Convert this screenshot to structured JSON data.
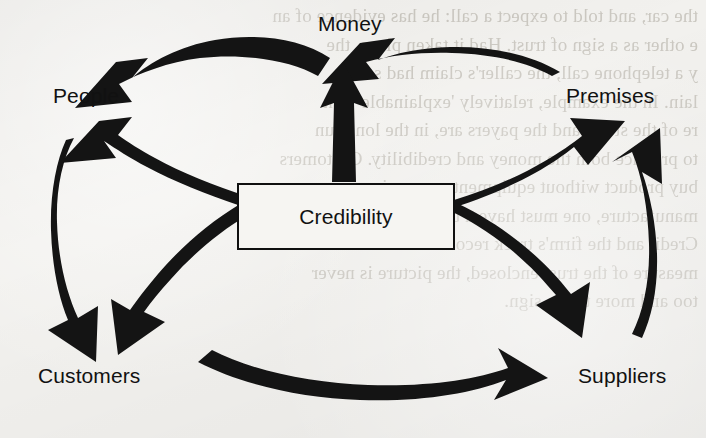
{
  "diagram": {
    "center": {
      "label": "Credibility"
    },
    "nodes": [
      {
        "id": "money",
        "label": "Money",
        "x": 318,
        "y": 12
      },
      {
        "id": "people",
        "label": "People",
        "x": 53,
        "y": 84
      },
      {
        "id": "premises",
        "label": "Premises",
        "x": 566,
        "y": 84
      },
      {
        "id": "customers",
        "label": "Customers",
        "x": 38,
        "y": 364
      },
      {
        "id": "suppliers",
        "label": "Suppliers",
        "x": 578,
        "y": 364
      }
    ],
    "arrows": [
      {
        "id": "money-to-people",
        "from": "money",
        "to": "people",
        "style": "curved-thick"
      },
      {
        "id": "premises-to-money",
        "from": "premises",
        "to": "money",
        "style": "curved-thick"
      },
      {
        "id": "credibility-to-money",
        "from": "credibility",
        "to": "money",
        "style": "straight-thick"
      },
      {
        "id": "credibility-to-people",
        "from": "credibility",
        "to": "people",
        "style": "curved-thick"
      },
      {
        "id": "credibility-to-premises",
        "from": "credibility",
        "to": "premises",
        "style": "curved-thick"
      },
      {
        "id": "credibility-to-suppliers",
        "from": "credibility",
        "to": "suppliers",
        "style": "curved-thick"
      },
      {
        "id": "credibility-to-customers",
        "from": "credibility",
        "to": "customers",
        "style": "curved-thick"
      },
      {
        "id": "people-to-customers",
        "from": "people",
        "to": "customers",
        "style": "curved-thick"
      },
      {
        "id": "suppliers-to-premises",
        "from": "suppliers",
        "to": "premises",
        "style": "curved-thick"
      },
      {
        "id": "customers-to-suppliers",
        "from": "customers",
        "to": "suppliers",
        "style": "curved-thick"
      }
    ],
    "colors": {
      "arrow": "#141414",
      "text": "#111111",
      "background": "#f2f1ee",
      "box_border": "#101010"
    }
  },
  "background_bleed": {
    "lines": [
      "the car, and told to expect a call: he has evidence of an",
      "e other as a sign of trust. Had it taken place, the",
      "y a telephone call, the caller's claim had some",
      "lain. In the example, relatively 'explainable' risk",
      "re of the story, and the payers are, in the long run",
      "to produce both the money and credibility. Customers",
      "buy product without equipment or premises, nor can",
      "manufacture, one must have a base of equipment",
      "Credit and the firm's track record with the funds is a",
      "measure of the trust enclosed, the picture is never",
      "too and more to the sign."
    ]
  }
}
